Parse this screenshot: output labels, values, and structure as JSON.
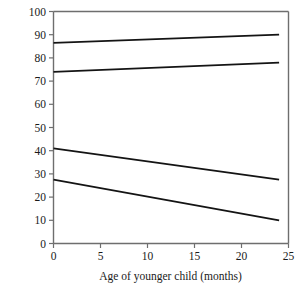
{
  "chart_data": {
    "type": "line",
    "title": "",
    "xlabel": "Age of younger child (months)",
    "ylabel": "Quality of older child's attachment to mother",
    "xlim": [
      0,
      25
    ],
    "ylim": [
      0,
      100
    ],
    "xticks": [
      0,
      5,
      10,
      15,
      20,
      25
    ],
    "yticks": [
      0,
      10,
      20,
      30,
      40,
      50,
      60,
      70,
      80,
      90,
      100
    ],
    "grid": false,
    "legend": "none",
    "line_color": "#141414",
    "axis_color": "#6e6e6e",
    "series": [
      {
        "name": "line-1-top",
        "x": [
          0,
          24
        ],
        "values": [
          86.5,
          90.0
        ]
      },
      {
        "name": "line-2-upper-middle",
        "x": [
          0,
          24
        ],
        "values": [
          74.0,
          78.0
        ]
      },
      {
        "name": "line-3-lower-middle",
        "x": [
          0,
          24
        ],
        "values": [
          41.0,
          27.5
        ]
      },
      {
        "name": "line-4-bottom",
        "x": [
          0,
          24
        ],
        "values": [
          27.5,
          10.0
        ]
      }
    ]
  }
}
